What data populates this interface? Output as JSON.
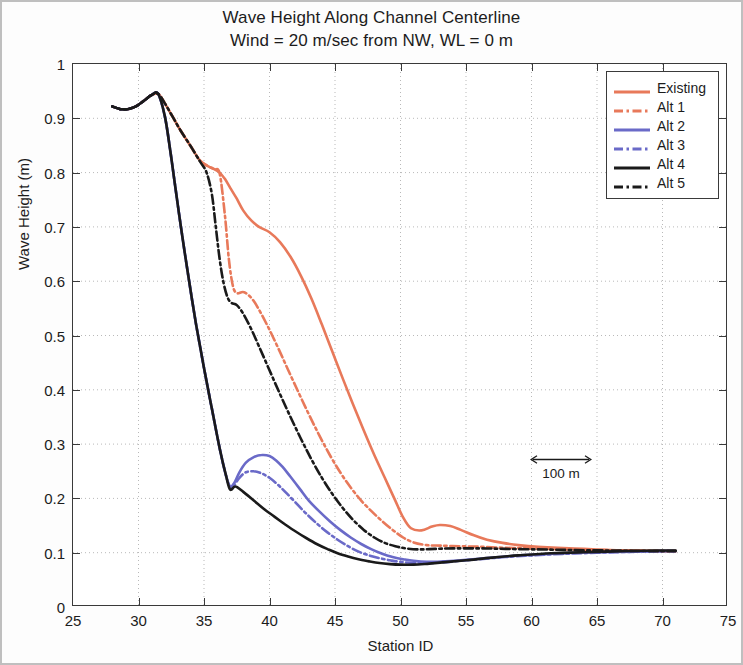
{
  "title": {
    "line1": "Wave Height Along Channel Centerline",
    "line2": "Wind = 20 m/sec from NW, WL = 0 m"
  },
  "annotation": {
    "scalebar_label": "100 m"
  },
  "colors": {
    "orange": "#e8795a",
    "blue": "#6a6ac8",
    "black": "#1a1a1a",
    "axis": "#3a3a3a",
    "grid": "#b9b9b9"
  },
  "chart_data": {
    "type": "line",
    "title": "Wave Height Along Channel Centerline\nWind = 20 m/sec from NW, WL = 0 m",
    "xlabel": "Station ID",
    "ylabel": "Wave Height (m)",
    "xlim": [
      25,
      75
    ],
    "ylim": [
      0,
      1
    ],
    "xticks": [
      25,
      30,
      35,
      40,
      45,
      50,
      55,
      60,
      65,
      70,
      75
    ],
    "yticks": [
      0,
      0.1,
      0.2,
      0.3,
      0.4,
      0.5,
      0.6,
      0.7,
      0.8,
      0.9,
      1
    ],
    "grid": true,
    "legend_position": "upper right",
    "annotations": [
      {
        "text": "100 m",
        "type": "scalebar",
        "x_start": 51.5,
        "x_end": 56.2,
        "y": 0.315
      }
    ],
    "series": [
      {
        "name": "Existing",
        "color": "#e8795a",
        "style": "solid",
        "x": [
          28.0,
          28.6,
          29.2,
          29.8,
          30.4,
          31.0,
          31.5,
          32.0,
          32.6,
          33.2,
          34.0,
          34.7,
          35.3,
          35.8,
          36.2,
          36.6,
          37.0,
          37.5,
          38.0,
          38.6,
          39.2,
          40.0,
          40.8,
          41.6,
          42.4,
          43.2,
          44.0,
          44.8,
          45.6,
          46.4,
          47.2,
          48.0,
          48.8,
          49.6,
          50.2,
          50.8,
          51.6,
          52.4,
          53.0,
          53.8,
          54.6,
          55.6,
          56.6,
          57.8,
          59.0,
          60.5,
          62.0,
          64.0,
          66.0,
          68.0,
          70.0,
          71.0
        ],
        "y": [
          0.922,
          0.917,
          0.917,
          0.922,
          0.932,
          0.943,
          0.945,
          0.928,
          0.903,
          0.878,
          0.848,
          0.822,
          0.812,
          0.806,
          0.8,
          0.788,
          0.772,
          0.752,
          0.73,
          0.712,
          0.7,
          0.69,
          0.672,
          0.645,
          0.61,
          0.568,
          0.52,
          0.47,
          0.42,
          0.372,
          0.325,
          0.28,
          0.238,
          0.196,
          0.165,
          0.145,
          0.141,
          0.148,
          0.151,
          0.149,
          0.142,
          0.132,
          0.124,
          0.118,
          0.114,
          0.111,
          0.109,
          0.107,
          0.105,
          0.104,
          0.103,
          0.103
        ]
      },
      {
        "name": "Alt 1",
        "color": "#e8795a",
        "style": "dashdot",
        "x": [
          28.0,
          28.6,
          29.2,
          29.8,
          30.4,
          31.0,
          31.5,
          32.0,
          32.6,
          33.2,
          34.0,
          34.7,
          35.3,
          35.8,
          36.2,
          36.6,
          36.9,
          37.2,
          37.5,
          38.0,
          38.5,
          39.0,
          39.8,
          40.6,
          41.4,
          42.2,
          43.0,
          43.8,
          44.6,
          45.4,
          46.2,
          47.0,
          47.8,
          48.6,
          49.4,
          50.2,
          51.0,
          52.0,
          53.0,
          54.5,
          56.0,
          58.0,
          60.0,
          62.5,
          65.0,
          68.0,
          70.0,
          71.0
        ],
        "y": [
          0.922,
          0.917,
          0.917,
          0.922,
          0.932,
          0.943,
          0.945,
          0.928,
          0.903,
          0.878,
          0.848,
          0.822,
          0.812,
          0.806,
          0.798,
          0.72,
          0.64,
          0.592,
          0.578,
          0.58,
          0.572,
          0.556,
          0.52,
          0.48,
          0.438,
          0.396,
          0.355,
          0.316,
          0.28,
          0.248,
          0.22,
          0.196,
          0.176,
          0.158,
          0.142,
          0.128,
          0.119,
          0.114,
          0.113,
          0.112,
          0.111,
          0.109,
          0.108,
          0.106,
          0.105,
          0.104,
          0.103,
          0.103
        ]
      },
      {
        "name": "Alt 2",
        "color": "#6a6ac8",
        "style": "solid",
        "x": [
          28.0,
          28.6,
          29.2,
          29.8,
          30.4,
          31.0,
          31.5,
          32.0,
          32.4,
          32.8,
          33.3,
          33.8,
          34.4,
          35.0,
          35.6,
          36.2,
          36.7,
          37.0,
          37.3,
          37.7,
          38.2,
          38.8,
          39.4,
          40.0,
          40.5,
          41.0,
          41.6,
          42.3,
          43.0,
          43.8,
          44.6,
          45.4,
          46.2,
          47.0,
          47.8,
          48.6,
          49.4,
          50.2,
          51.0,
          52.0,
          53.2,
          54.6,
          56.0,
          58.0,
          60.0,
          62.5,
          65.0,
          68.0,
          70.0,
          71.0
        ],
        "y": [
          0.922,
          0.917,
          0.917,
          0.922,
          0.932,
          0.943,
          0.945,
          0.905,
          0.845,
          0.775,
          0.69,
          0.61,
          0.52,
          0.44,
          0.365,
          0.292,
          0.24,
          0.222,
          0.228,
          0.248,
          0.266,
          0.276,
          0.28,
          0.278,
          0.27,
          0.258,
          0.24,
          0.218,
          0.196,
          0.176,
          0.158,
          0.142,
          0.128,
          0.116,
          0.106,
          0.098,
          0.092,
          0.088,
          0.085,
          0.083,
          0.084,
          0.086,
          0.089,
          0.093,
          0.096,
          0.099,
          0.101,
          0.102,
          0.103,
          0.103
        ]
      },
      {
        "name": "Alt 3",
        "color": "#6a6ac8",
        "style": "dashdot",
        "x": [
          28.0,
          28.6,
          29.2,
          29.8,
          30.4,
          31.0,
          31.5,
          32.0,
          32.4,
          32.8,
          33.3,
          33.8,
          34.4,
          35.0,
          35.6,
          36.2,
          36.7,
          37.0,
          37.3,
          37.7,
          38.2,
          38.8,
          39.4,
          40.0,
          40.6,
          41.2,
          42.0,
          42.8,
          43.6,
          44.4,
          45.2,
          46.0,
          46.8,
          47.6,
          48.4,
          49.2,
          50.0,
          51.0,
          52.0,
          53.2,
          54.6,
          56.0,
          58.0,
          60.0,
          62.5,
          65.0,
          68.0,
          70.0,
          71.0
        ],
        "y": [
          0.922,
          0.917,
          0.917,
          0.922,
          0.932,
          0.943,
          0.945,
          0.905,
          0.845,
          0.775,
          0.69,
          0.61,
          0.52,
          0.44,
          0.365,
          0.292,
          0.24,
          0.22,
          0.224,
          0.238,
          0.248,
          0.25,
          0.246,
          0.238,
          0.226,
          0.212,
          0.192,
          0.172,
          0.154,
          0.138,
          0.124,
          0.112,
          0.102,
          0.095,
          0.09,
          0.086,
          0.083,
          0.081,
          0.081,
          0.082,
          0.085,
          0.088,
          0.092,
          0.095,
          0.098,
          0.1,
          0.102,
          0.103,
          0.103
        ]
      },
      {
        "name": "Alt 4",
        "color": "#1a1a1a",
        "style": "solid",
        "x": [
          28.0,
          28.6,
          29.2,
          29.8,
          30.4,
          31.0,
          31.5,
          32.0,
          32.4,
          32.8,
          33.3,
          33.8,
          34.4,
          35.0,
          35.6,
          36.2,
          36.7,
          37.0,
          37.4,
          38.0,
          38.8,
          39.6,
          40.4,
          41.2,
          42.0,
          42.8,
          43.6,
          44.4,
          45.2,
          46.0,
          46.8,
          47.6,
          48.4,
          49.2,
          50.0,
          51.0,
          52.2,
          53.6,
          55.0,
          57.0,
          59.0,
          61.5,
          64.0,
          67.0,
          69.5,
          71.0
        ],
        "y": [
          0.922,
          0.917,
          0.917,
          0.922,
          0.932,
          0.943,
          0.945,
          0.905,
          0.845,
          0.775,
          0.69,
          0.61,
          0.52,
          0.44,
          0.365,
          0.292,
          0.24,
          0.216,
          0.222,
          0.212,
          0.196,
          0.18,
          0.166,
          0.152,
          0.139,
          0.127,
          0.116,
          0.107,
          0.099,
          0.093,
          0.088,
          0.084,
          0.081,
          0.079,
          0.078,
          0.078,
          0.08,
          0.083,
          0.086,
          0.091,
          0.095,
          0.099,
          0.101,
          0.103,
          0.104,
          0.104
        ]
      },
      {
        "name": "Alt 5",
        "color": "#1a1a1a",
        "style": "dashdot",
        "x": [
          28.0,
          28.6,
          29.2,
          29.8,
          30.4,
          31.0,
          31.5,
          32.0,
          32.6,
          33.2,
          34.0,
          34.7,
          35.2,
          35.6,
          35.9,
          36.2,
          36.5,
          36.8,
          37.1,
          37.5,
          38.0,
          38.6,
          39.2,
          40.0,
          40.8,
          41.6,
          42.4,
          43.2,
          44.0,
          44.8,
          45.6,
          46.4,
          47.2,
          48.0,
          48.8,
          49.6,
          50.4,
          51.5,
          52.6,
          54.0,
          56.0,
          58.0,
          60.5,
          63.0,
          66.0,
          69.0,
          71.0
        ],
        "y": [
          0.922,
          0.917,
          0.917,
          0.922,
          0.932,
          0.943,
          0.945,
          0.928,
          0.903,
          0.878,
          0.848,
          0.82,
          0.8,
          0.76,
          0.7,
          0.64,
          0.596,
          0.57,
          0.56,
          0.556,
          0.54,
          0.512,
          0.48,
          0.436,
          0.392,
          0.35,
          0.31,
          0.272,
          0.238,
          0.208,
          0.182,
          0.16,
          0.142,
          0.128,
          0.118,
          0.112,
          0.108,
          0.106,
          0.107,
          0.108,
          0.108,
          0.107,
          0.106,
          0.105,
          0.104,
          0.103,
          0.103
        ]
      }
    ]
  }
}
